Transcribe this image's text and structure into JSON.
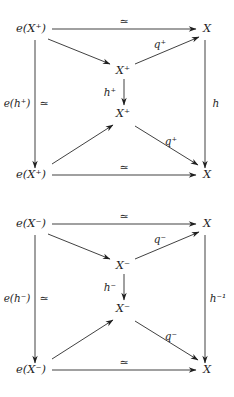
{
  "figure": {
    "kind": "commutative-diagram-pair",
    "background_color": "#ffffff",
    "ink_color": "#1f1f1f",
    "width": 234,
    "height": 397,
    "diagrams": [
      {
        "id": "diagram-plus",
        "sign": "+",
        "nodes": {
          "top_left": "e(X⁺)",
          "top_right": "X",
          "mid_upper": "X⁺",
          "mid_lower": "X⁺",
          "bottom_left": "e(X⁺)",
          "bottom_right": "X"
        },
        "edges": {
          "top_horizontal": "≃",
          "bottom_horizontal": "≃",
          "left_vertical": "e(h⁺)",
          "left_vertical_extra": "≃",
          "right_vertical": "h",
          "center_vertical": "h⁺",
          "diag_upper_right": "q⁺",
          "diag_lower_right": "q⁺",
          "diag_upper_left": "",
          "diag_lower_left": ""
        }
      },
      {
        "id": "diagram-minus",
        "sign": "−",
        "nodes": {
          "top_left": "e(X⁻)",
          "top_right": "X",
          "mid_upper": "X⁻",
          "mid_lower": "X⁻",
          "bottom_left": "e(X⁻)",
          "bottom_right": "X"
        },
        "edges": {
          "top_horizontal": "≃",
          "bottom_horizontal": "≃",
          "left_vertical": "e(h⁻)",
          "left_vertical_extra": "≃",
          "right_vertical": "h⁻¹",
          "center_vertical": "h⁻",
          "diag_upper_right": "q⁻",
          "diag_lower_right": "q⁻",
          "diag_upper_left": "",
          "diag_lower_left": ""
        }
      }
    ]
  }
}
